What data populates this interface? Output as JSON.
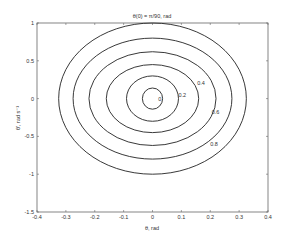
{
  "chart_data": {
    "type": "line",
    "subtype": "contour",
    "title": "θ(0) = π/90, rad",
    "xlabel": "θ, rad",
    "ylabel": "θ', rad s⁻¹",
    "xlim": [
      -0.4,
      0.4
    ],
    "ylim": [
      -1.5,
      1
    ],
    "xticks": [
      "-0.4",
      "-0.3",
      "-0.2",
      "-0.1",
      "0",
      "0.1",
      "0.2",
      "0.3",
      "0.4"
    ],
    "yticks": [
      "1",
      "0.5",
      "0",
      "-0.5",
      "-1",
      "-1.5"
    ],
    "grid": false,
    "legend": null,
    "series": [
      {
        "name": "0",
        "rx": 0.035,
        "ry": 0.14,
        "label_at": [
          0.02,
          0.0
        ]
      },
      {
        "name": "0.2",
        "rx": 0.09,
        "ry": 0.3,
        "label_at": [
          0.09,
          0.05
        ]
      },
      {
        "name": "0.4",
        "rx": 0.16,
        "ry": 0.45,
        "label_at": [
          0.155,
          0.2
        ]
      },
      {
        "name": "0.6",
        "rx": 0.22,
        "ry": 0.62,
        "label_at": [
          0.205,
          -0.18
        ]
      },
      {
        "name": "0.8",
        "rx": 0.275,
        "ry": 0.8,
        "label_at": [
          0.2,
          -0.6
        ]
      },
      {
        "name": "1",
        "rx": 0.325,
        "ry": 1.0,
        "label_at": null
      }
    ]
  }
}
